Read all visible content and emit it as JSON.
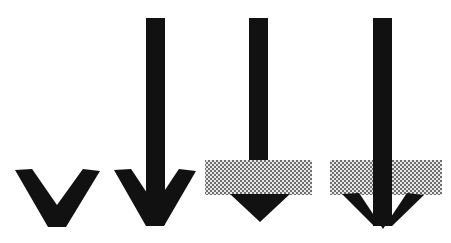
{
  "figure": {
    "canvas": {
      "width": 451,
      "height": 243,
      "background": "#ffffff"
    },
    "colors": {
      "arrow_fill": "#111111",
      "band_dark": "#6e6e6e",
      "band_light": "#e8e8e8",
      "background": "#ffffff"
    },
    "band_pattern": {
      "name": "checkerboard-dither",
      "cell_size_px": 2,
      "description": "50% checkerboard halftone fill"
    },
    "panels": [
      {
        "id": "panel-1",
        "label": "chevron-only",
        "has_shaft": false,
        "has_band": false,
        "head_style": "chevron",
        "head": {
          "left_x": 15,
          "right_x": 100,
          "top_y": 170,
          "tip_y": 227,
          "center_x": 57,
          "stroke_px": 18
        }
      },
      {
        "id": "panel-2",
        "label": "arrow-chevron-head",
        "has_shaft": true,
        "has_band": false,
        "head_style": "chevron",
        "shaft": {
          "left_x": 146,
          "right_x": 165,
          "top_y": 18,
          "bottom_y": 225,
          "width_px": 19
        },
        "head": {
          "left_x": 114,
          "right_x": 196,
          "top_y": 170,
          "tip_y": 226,
          "center_x": 155,
          "stroke_px": 18
        }
      },
      {
        "id": "panel-3",
        "label": "arrow-stopped-at-band-solid-triangle",
        "has_shaft": true,
        "has_band": true,
        "head_style": "solid-triangle",
        "shaft": {
          "left_x": 249,
          "right_x": 268,
          "top_y": 18,
          "bottom_y": 163,
          "width_px": 19
        },
        "band": {
          "left_x": 205,
          "right_x": 312,
          "top_y": 160,
          "bottom_y": 195,
          "height_px": 35
        },
        "head": {
          "left_x": 230,
          "right_x": 290,
          "top_y": 194,
          "tip_y": 222,
          "center_x": 260
        }
      },
      {
        "id": "panel-4",
        "label": "arrow-through-band-chevron-head",
        "has_shaft": true,
        "has_band": true,
        "head_style": "chevron",
        "shaft": {
          "left_x": 373,
          "right_x": 392,
          "top_y": 18,
          "bottom_y": 226,
          "width_px": 19
        },
        "band": {
          "left_x": 330,
          "right_x": 442,
          "top_y": 160,
          "bottom_y": 195,
          "height_px": 35
        },
        "head": {
          "left_x": 342,
          "right_x": 424,
          "top_y": 194,
          "tip_y": 226,
          "center_x": 383,
          "stroke_px": 18
        }
      }
    ]
  }
}
